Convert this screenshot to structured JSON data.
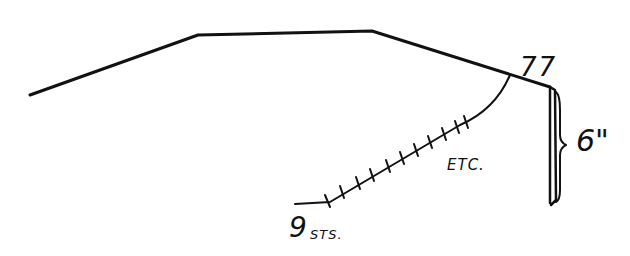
{
  "diagram": {
    "kind": "hand-drawn knitting shaping sketch",
    "ink_color": "#111111",
    "background": "#ffffff",
    "labels": {
      "stitch_counts": "77",
      "height": "6\"",
      "continuation": "ETC.",
      "start_count": "9",
      "start_unit": "STS."
    }
  }
}
